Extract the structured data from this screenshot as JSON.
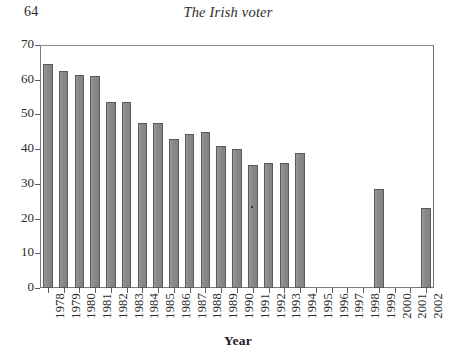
{
  "page": {
    "folio": "64",
    "running_title": "The Irish voter"
  },
  "chart_data": {
    "type": "bar",
    "title": "",
    "xlabel": "Year",
    "ylabel": "",
    "categories": [
      "1978",
      "1979",
      "1980",
      "1981",
      "1982",
      "1983",
      "1984",
      "1985",
      "1986",
      "1987",
      "1988",
      "1989",
      "1990",
      "1991",
      "1992",
      "1993",
      "1994",
      "1995",
      "1996",
      "1997",
      "1998",
      "1999",
      "2000",
      "2001",
      "2002"
    ],
    "values": [
      64.5,
      62.5,
      61.5,
      61.0,
      53.5,
      53.5,
      47.5,
      47.5,
      43.0,
      44.5,
      45.0,
      41.0,
      40.0,
      35.3,
      36.0,
      36.0,
      39.0,
      null,
      null,
      null,
      null,
      28.5,
      null,
      null,
      23.0
    ],
    "ylim": [
      0,
      70
    ],
    "yticks": [
      0,
      10,
      20,
      30,
      40,
      50,
      60,
      70
    ],
    "ytick_labels": [
      "0",
      "10",
      "20",
      "30",
      "40",
      "50",
      "60",
      "70"
    ],
    "grid": false,
    "legend": null,
    "bar_color": "#8d8d8d",
    "bar_edge_color": "#5a5a5a",
    "axis_color": "#5d5d5d"
  }
}
